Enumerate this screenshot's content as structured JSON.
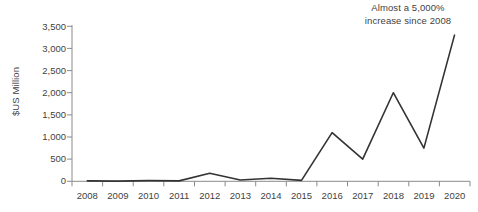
{
  "chart_data": {
    "type": "line",
    "title": "",
    "subtitle": "",
    "xlabel": "",
    "ylabel": "$US Million",
    "categories": [
      "2008",
      "2009",
      "2010",
      "2011",
      "2012",
      "2013",
      "2014",
      "2015",
      "2016",
      "2017",
      "2018",
      "2019",
      "2020"
    ],
    "values": [
      10,
      5,
      15,
      10,
      180,
      30,
      70,
      20,
      1100,
      500,
      2000,
      750,
      3300
    ],
    "series": [
      {
        "name": "$US Million",
        "values": [
          10,
          5,
          15,
          10,
          180,
          30,
          70,
          20,
          1100,
          500,
          2000,
          750,
          3300
        ]
      }
    ],
    "ylim": [
      0,
      3500
    ],
    "ytick_values": [
      0,
      500,
      1000,
      1500,
      2000,
      2500,
      3000,
      3500
    ],
    "ytick_labels": [
      "0",
      "500",
      "1,000",
      "1,500",
      "2,000",
      "2,500",
      "3,000",
      "3,500"
    ],
    "xtick_labels": [
      "2008",
      "2009",
      "2010",
      "2011",
      "2012",
      "2013",
      "2014",
      "2015",
      "2016",
      "2017",
      "2018",
      "2019",
      "2020"
    ],
    "grid": false,
    "legend": "none",
    "line_color": "#333333",
    "axis_color": "#888888",
    "text_color": "#3f3f3f",
    "background_color": "#ffffff",
    "annotations": [
      {
        "name": "growth-callout",
        "lines": [
          "Almost a 5,000%",
          "increase since 2008"
        ],
        "position": "top-right"
      }
    ]
  }
}
